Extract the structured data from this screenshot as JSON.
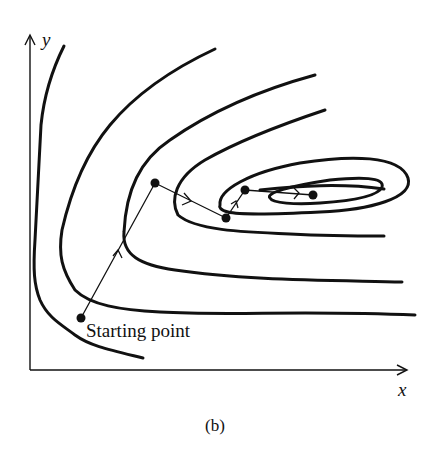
{
  "figure": {
    "caption": "(b)",
    "x_axis_label": "x",
    "y_axis_label": "y",
    "start_label": "Starting point",
    "search_path": {
      "points": [
        {
          "id": "p0",
          "x": 81,
          "y": 318,
          "label": "Starting point"
        },
        {
          "id": "p1",
          "x": 155,
          "y": 183
        },
        {
          "id": "p2",
          "x": 226,
          "y": 218
        },
        {
          "id": "p3",
          "x": 245,
          "y": 190
        },
        {
          "id": "p4",
          "x": 313,
          "y": 195
        }
      ]
    },
    "contour_count": 7,
    "colors": {
      "ink": "#111111",
      "background": "#ffffff"
    }
  }
}
